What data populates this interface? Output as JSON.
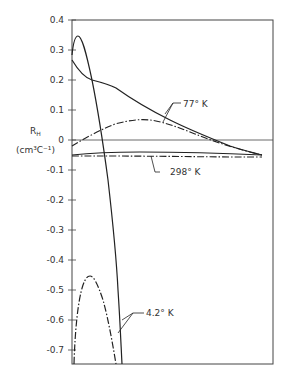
{
  "chart_data": {
    "type": "line",
    "title": "",
    "xlabel": "",
    "ylabel": "R_H (cm3 C-1)",
    "ylabel_main": "R",
    "ylabel_sub": "H",
    "ylabel_units": "(cm³C⁻¹)",
    "ylim": [
      -0.75,
      0.4
    ],
    "grid": false,
    "legend": "inline labels",
    "y_ticks": [
      0.4,
      0.3,
      0.2,
      0.1,
      0,
      -0.1,
      -0.2,
      -0.3,
      -0.4,
      -0.5,
      -0.6,
      -0.7
    ],
    "y_tick_labels": [
      "0.4",
      "0.3",
      "0.2",
      "0.1",
      "0",
      "-0.1",
      "-0.2",
      "-0.3",
      "-0.4",
      "-0.5",
      "-0.6",
      "-0.7"
    ],
    "series": [
      {
        "name": "4.2° K (solid)",
        "style": "solid",
        "points": [
          [
            0.0,
            0.28
          ],
          [
            0.02,
            0.33
          ],
          [
            0.035,
            0.345
          ],
          [
            0.06,
            0.3
          ],
          [
            0.1,
            0.18
          ],
          [
            0.15,
            0.0
          ],
          [
            0.2,
            -0.2
          ],
          [
            0.24,
            -0.4
          ],
          [
            0.26,
            -0.55
          ],
          [
            0.28,
            -0.75
          ]
        ]
      },
      {
        "name": "4.2° K (dash-dot)",
        "style": "dash-dot",
        "points": [
          [
            0.0,
            -0.75
          ],
          [
            0.02,
            -0.62
          ],
          [
            0.05,
            -0.5
          ],
          [
            0.085,
            -0.45
          ],
          [
            0.12,
            -0.48
          ],
          [
            0.17,
            -0.58
          ],
          [
            0.21,
            -0.68
          ],
          [
            0.24,
            -0.75
          ]
        ]
      },
      {
        "name": "77° K (solid)",
        "style": "solid",
        "points": [
          [
            0.0,
            0.27
          ],
          [
            0.03,
            0.21
          ],
          [
            0.1,
            0.18
          ],
          [
            0.2,
            0.165
          ],
          [
            0.3,
            0.13
          ],
          [
            0.45,
            0.07
          ],
          [
            0.6,
            0.01
          ],
          [
            0.75,
            -0.03
          ],
          [
            0.94,
            -0.05
          ]
        ]
      },
      {
        "name": "77° K (dash-dot)",
        "style": "dash-dot",
        "points": [
          [
            0.0,
            -0.02
          ],
          [
            0.1,
            0.01
          ],
          [
            0.2,
            0.04
          ],
          [
            0.35,
            0.065
          ],
          [
            0.5,
            0.06
          ],
          [
            0.65,
            0.02
          ],
          [
            0.8,
            -0.02
          ],
          [
            0.94,
            -0.05
          ]
        ]
      },
      {
        "name": "298° K (solid)",
        "style": "solid",
        "points": [
          [
            0.0,
            -0.05
          ],
          [
            0.1,
            -0.045
          ],
          [
            0.3,
            -0.04
          ],
          [
            0.5,
            -0.04
          ],
          [
            0.7,
            -0.042
          ],
          [
            0.94,
            -0.05
          ]
        ]
      },
      {
        "name": "298° K (dash-dot)",
        "style": "dash-dot",
        "points": [
          [
            0.0,
            -0.05
          ],
          [
            0.1,
            -0.05
          ],
          [
            0.3,
            -0.052
          ],
          [
            0.5,
            -0.052
          ],
          [
            0.7,
            -0.054
          ],
          [
            0.94,
            -0.055
          ]
        ]
      }
    ],
    "annotations": [
      {
        "text": "77° K",
        "x_px": 183,
        "y_px": 106
      },
      {
        "text": "298° K",
        "x_px": 170,
        "y_px": 175
      },
      {
        "text": "4.2° K",
        "x_px": 146,
        "y_px": 316
      }
    ]
  }
}
